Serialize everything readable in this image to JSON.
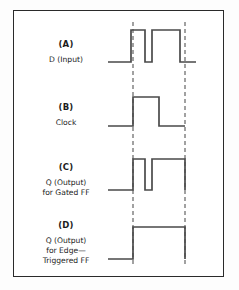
{
  "figure": {
    "background_color": "#fdfdfd",
    "frame_color": "#2a2a2a",
    "wave_color": "#4a4a4a",
    "marker_color": "#555555"
  },
  "markers": {
    "line_1_x": 133,
    "line_2_x": 185,
    "label_1": "clock rising edge",
    "label_2": "clock cycle end"
  },
  "rows": [
    {
      "tag": "(A)",
      "desc_lines": [
        "D (Input)"
      ],
      "name": "waveform-d-input",
      "baseline_y": 62,
      "high_y": 30,
      "path": "M 108 62 L 131 62 L 131 30 L 145 30 L 145 62 L 152 62 L 152 30 L 180 30 L 180 62 L 196 62"
    },
    {
      "tag": "(B)",
      "desc_lines": [
        "Clock"
      ],
      "name": "waveform-clock",
      "baseline_y": 126,
      "high_y": 97,
      "path": "M 108 126 L 133 126 L 133 97 L 159 97 L 159 126 L 185 126"
    },
    {
      "tag": "(C)",
      "desc_lines": [
        "Q (Output)",
        "for Gated FF"
      ],
      "name": "waveform-q-gated",
      "baseline_y": 190,
      "high_y": 159,
      "path": "M 108 190 L 133 190 L 133 159 L 145 159 L 145 190 L 152 190 L 152 159 L 185 159 L 185 190"
    },
    {
      "tag": "(D)",
      "desc_lines": [
        "Q (Output)",
        "for Edge—",
        "Triggered FF"
      ],
      "name": "waveform-q-edge",
      "baseline_y": 259,
      "high_y": 227,
      "path": "M 108 259 L 133 259 L 133 227 L 185 227 L 185 259"
    }
  ],
  "chart_data": {
    "type": "line",
    "xlabel": "time",
    "ylabel": "logic level",
    "grid": false,
    "legend_position": "left",
    "x_markers": [
      133,
      185
    ],
    "series": [
      {
        "name": "(A) D (Input)",
        "transitions": [
          {
            "x": 108,
            "level": 0
          },
          {
            "x": 131,
            "level": 1
          },
          {
            "x": 145,
            "level": 0
          },
          {
            "x": 152,
            "level": 1
          },
          {
            "x": 180,
            "level": 0
          },
          {
            "x": 196,
            "level": 0
          }
        ]
      },
      {
        "name": "(B) Clock",
        "transitions": [
          {
            "x": 108,
            "level": 0
          },
          {
            "x": 133,
            "level": 1
          },
          {
            "x": 159,
            "level": 0
          },
          {
            "x": 185,
            "level": 0
          }
        ]
      },
      {
        "name": "(C) Q (Output) for Gated FF",
        "transitions": [
          {
            "x": 108,
            "level": 0
          },
          {
            "x": 133,
            "level": 1
          },
          {
            "x": 145,
            "level": 0
          },
          {
            "x": 152,
            "level": 1
          },
          {
            "x": 185,
            "level": 0
          }
        ]
      },
      {
        "name": "(D) Q (Output) for Edge-Triggered FF",
        "transitions": [
          {
            "x": 108,
            "level": 0
          },
          {
            "x": 133,
            "level": 1
          },
          {
            "x": 185,
            "level": 0
          }
        ]
      }
    ]
  }
}
